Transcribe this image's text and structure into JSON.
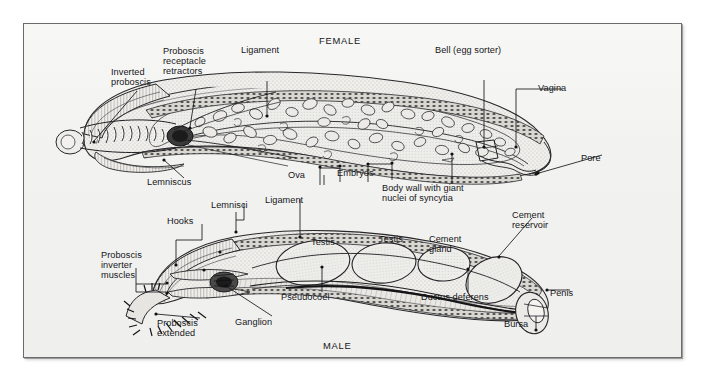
{
  "figure": {
    "title_female": "FEMALE",
    "title_male": "MALE",
    "background": "#f4f4f2",
    "ink": "#16161a",
    "frame_color": "#6b6b6b"
  },
  "female": {
    "labels": [
      {
        "id": "inverted-proboscis",
        "text": "Inverted\nproboscis",
        "x": 110,
        "y": 66,
        "align": "left"
      },
      {
        "id": "proboscis-receptacle-retractors",
        "text": "Proboscis\nreceptacle\nretractors",
        "x": 162,
        "y": 45,
        "align": "left"
      },
      {
        "id": "ligament-female",
        "text": "Ligament",
        "x": 240,
        "y": 44,
        "align": "left"
      },
      {
        "id": "bell-egg-sorter",
        "text": "Bell (egg sorter)",
        "x": 434,
        "y": 44,
        "align": "left"
      },
      {
        "id": "vagina",
        "text": "Vagina",
        "x": 537,
        "y": 82,
        "align": "left"
      },
      {
        "id": "pore",
        "text": "Pore",
        "x": 580,
        "y": 152,
        "align": "left"
      },
      {
        "id": "ova",
        "text": "Ova",
        "x": 287,
        "y": 169,
        "align": "left"
      },
      {
        "id": "embryos",
        "text": "Embryos",
        "x": 336,
        "y": 167,
        "align": "left"
      },
      {
        "id": "lemniscus",
        "text": "Lemniscus",
        "x": 146,
        "y": 176,
        "align": "left"
      },
      {
        "id": "body-wall-giant-nuclei",
        "text": "Body wall with giant\nnuclei of syncytia",
        "x": 381,
        "y": 182,
        "align": "left"
      }
    ]
  },
  "male": {
    "labels": [
      {
        "id": "lemnisci",
        "text": "Lemnisci",
        "x": 210,
        "y": 199,
        "align": "left"
      },
      {
        "id": "ligament-male",
        "text": "Ligament",
        "x": 264,
        "y": 194,
        "align": "left"
      },
      {
        "id": "hooks",
        "text": "Hooks",
        "x": 166,
        "y": 215,
        "align": "left"
      },
      {
        "id": "cement-reservoir",
        "text": "Cement\nreservoir",
        "x": 511,
        "y": 209,
        "align": "left"
      },
      {
        "id": "proboscis-inverter-muscles",
        "text": "Proboscis\ninverter\nmuscles",
        "x": 100,
        "y": 249,
        "align": "left"
      },
      {
        "id": "testis-1",
        "text": "Testis",
        "x": 310,
        "y": 236,
        "align": "left"
      },
      {
        "id": "testis-2",
        "text": "Testis",
        "x": 378,
        "y": 233,
        "align": "left"
      },
      {
        "id": "cement-gland",
        "text": "Cement\ngland",
        "x": 428,
        "y": 233,
        "align": "left"
      },
      {
        "id": "pseudocoel",
        "text": "Pseudocoel",
        "x": 280,
        "y": 291,
        "align": "left"
      },
      {
        "id": "ductus-deferens",
        "text": "Ductus deferens",
        "x": 420,
        "y": 291,
        "align": "left"
      },
      {
        "id": "penis",
        "text": "Penis",
        "x": 549,
        "y": 287,
        "align": "left"
      },
      {
        "id": "bursa",
        "text": "Bursa",
        "x": 503,
        "y": 318,
        "align": "left"
      },
      {
        "id": "ganglion",
        "text": "Ganglion",
        "x": 234,
        "y": 316,
        "align": "left"
      },
      {
        "id": "proboscis-extended",
        "text": "Proboscis\nextended",
        "x": 156,
        "y": 317,
        "align": "left"
      }
    ]
  },
  "titles": {
    "female_pos": {
      "x": 318,
      "y": 34
    },
    "male_pos": {
      "x": 322,
      "y": 339
    }
  }
}
